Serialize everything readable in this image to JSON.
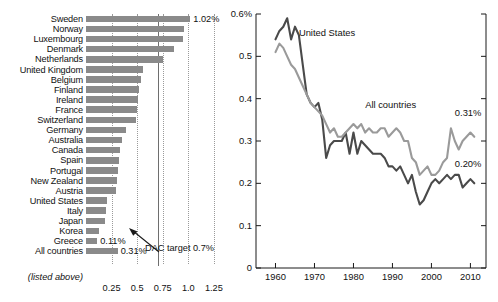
{
  "chart_data": [
    {
      "type": "bar",
      "id": "oda-by-country",
      "orientation": "horizontal",
      "title": "",
      "xlabel": "",
      "ylabel": "",
      "xlim": [
        0,
        1.32
      ],
      "grid": true,
      "gridlines": [
        0.25,
        0.5,
        0.75,
        1.0,
        1.25
      ],
      "target_line": 0.7,
      "tick_labels": [
        "0.25",
        "0.5",
        "0.75",
        "1.0",
        "1.25"
      ],
      "tick_values": [
        0.25,
        0.5,
        0.75,
        1.0,
        1.25
      ],
      "categories": [
        "Sweden",
        "Norway",
        "Luxembourg",
        "Denmark",
        "Netherlands",
        "United Kingdom",
        "Belgium",
        "Finland",
        "Ireland",
        "France",
        "Switzerland",
        "Germany",
        "Australia",
        "Canada",
        "Spain",
        "Portugal",
        "New Zealand",
        "Austria",
        "United States",
        "Italy",
        "Japan",
        "Korea",
        "Greece",
        "All countries"
      ],
      "values": [
        1.02,
        0.96,
        0.95,
        0.86,
        0.75,
        0.56,
        0.54,
        0.52,
        0.51,
        0.5,
        0.49,
        0.39,
        0.35,
        0.33,
        0.32,
        0.31,
        0.3,
        0.29,
        0.21,
        0.2,
        0.19,
        0.13,
        0.11,
        0.31
      ],
      "data_labels": [
        {
          "category": "Sweden",
          "text": "1.02%"
        },
        {
          "category": "Greece",
          "text": "0.11%"
        },
        {
          "category": "All countries",
          "text": "0.31%"
        }
      ],
      "annotations": [
        {
          "text": "DAC target 0.7%",
          "points_to": 0.7
        },
        {
          "text": "(listed above)",
          "note": "caption under All countries label"
        }
      ]
    },
    {
      "type": "line",
      "id": "oda-history",
      "title": "",
      "xlabel": "",
      "ylabel": "",
      "xlim": [
        1955,
        2014
      ],
      "ylim": [
        0,
        0.6
      ],
      "grid": false,
      "ytick_labels": [
        "0",
        "0.1",
        "0.2",
        "0.3",
        "0.4",
        "0.5",
        "0.6%"
      ],
      "ytick_values": [
        0,
        0.1,
        0.2,
        0.3,
        0.4,
        0.5,
        0.6
      ],
      "xtick_labels": [
        "1960",
        "1970",
        "1980",
        "1990",
        "2000",
        "2010"
      ],
      "xtick_values": [
        1960,
        1970,
        1980,
        1990,
        2000,
        2010
      ],
      "legend_position": "inline-labels",
      "x": [
        1960,
        1961,
        1962,
        1963,
        1964,
        1965,
        1966,
        1967,
        1968,
        1969,
        1970,
        1971,
        1972,
        1973,
        1974,
        1975,
        1976,
        1977,
        1978,
        1979,
        1980,
        1981,
        1982,
        1983,
        1984,
        1985,
        1986,
        1987,
        1988,
        1989,
        1990,
        1991,
        1992,
        1993,
        1994,
        1995,
        1996,
        1997,
        1998,
        1999,
        2000,
        2001,
        2002,
        2003,
        2004,
        2005,
        2006,
        2007,
        2008,
        2009,
        2010,
        2011
      ],
      "series": [
        {
          "name": "United States",
          "color": "#4a4a4a",
          "end_label": "0.20%",
          "values": [
            0.54,
            0.56,
            0.57,
            0.59,
            0.54,
            0.57,
            0.55,
            0.48,
            0.41,
            0.39,
            0.38,
            0.39,
            0.35,
            0.26,
            0.29,
            0.3,
            0.3,
            0.3,
            0.32,
            0.27,
            0.32,
            0.27,
            0.3,
            0.29,
            0.28,
            0.27,
            0.27,
            0.27,
            0.26,
            0.24,
            0.24,
            0.23,
            0.24,
            0.22,
            0.2,
            0.22,
            0.18,
            0.15,
            0.16,
            0.18,
            0.2,
            0.21,
            0.2,
            0.21,
            0.22,
            0.21,
            0.22,
            0.22,
            0.19,
            0.2,
            0.21,
            0.2
          ]
        },
        {
          "name": "All countries",
          "color": "#9a9a9a",
          "end_label": "0.31%",
          "values": [
            0.51,
            0.53,
            0.52,
            0.5,
            0.48,
            0.47,
            0.45,
            0.43,
            0.41,
            0.39,
            0.38,
            0.37,
            0.36,
            0.34,
            0.32,
            0.33,
            0.31,
            0.31,
            0.32,
            0.33,
            0.34,
            0.33,
            0.34,
            0.32,
            0.33,
            0.32,
            0.32,
            0.33,
            0.33,
            0.31,
            0.32,
            0.33,
            0.32,
            0.3,
            0.3,
            0.26,
            0.25,
            0.22,
            0.23,
            0.24,
            0.22,
            0.22,
            0.23,
            0.25,
            0.26,
            0.33,
            0.3,
            0.28,
            0.3,
            0.31,
            0.32,
            0.31
          ]
        }
      ],
      "annotations": [
        {
          "text": "United States",
          "x": 1966,
          "y": 0.555
        },
        {
          "text": "All countries",
          "x": 1983,
          "y": 0.385
        },
        {
          "text": "0.31%",
          "x": 2006,
          "y": 0.365
        },
        {
          "text": "0.20%",
          "x": 2006,
          "y": 0.245
        }
      ]
    }
  ]
}
